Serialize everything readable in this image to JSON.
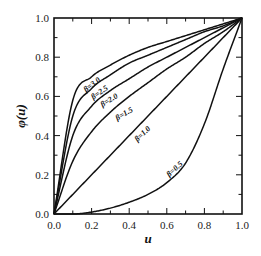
{
  "chart_data": {
    "type": "line",
    "title": "",
    "xlabel": "u",
    "ylabel": "φ(u)",
    "xlim": [
      0.0,
      1.0
    ],
    "ylim": [
      0.0,
      1.0
    ],
    "grid": false,
    "legend": "inline labels along curves",
    "xticks": [
      "0.0",
      "0.2",
      "0.4",
      "0.6",
      "0.8",
      "1.0"
    ],
    "yticks": [
      "0.0",
      "0.2",
      "0.4",
      "0.6",
      "0.8",
      "1.0"
    ],
    "x": [
      0.0,
      0.1,
      0.2,
      0.3,
      0.4,
      0.5,
      0.6,
      0.7,
      0.8,
      0.9,
      1.0
    ],
    "series": [
      {
        "name": "β=3.0",
        "values": [
          0.0,
          0.58,
          0.7,
          0.76,
          0.81,
          0.85,
          0.88,
          0.91,
          0.94,
          0.97,
          1.0
        ]
      },
      {
        "name": "β=2.5",
        "values": [
          0.0,
          0.5,
          0.64,
          0.71,
          0.77,
          0.81,
          0.85,
          0.89,
          0.93,
          0.96,
          1.0
        ]
      },
      {
        "name": "β=2.0",
        "values": [
          0.0,
          0.4,
          0.55,
          0.63,
          0.69,
          0.75,
          0.8,
          0.85,
          0.9,
          0.95,
          1.0
        ]
      },
      {
        "name": "β=1.5",
        "values": [
          0.0,
          0.27,
          0.42,
          0.52,
          0.6,
          0.67,
          0.74,
          0.8,
          0.87,
          0.93,
          1.0
        ]
      },
      {
        "name": "β=1.0",
        "values": [
          0.0,
          0.1,
          0.2,
          0.3,
          0.4,
          0.5,
          0.6,
          0.7,
          0.8,
          0.9,
          1.0
        ]
      },
      {
        "name": "β=0.5",
        "values": [
          0.0,
          0.0,
          0.01,
          0.03,
          0.06,
          0.1,
          0.16,
          0.26,
          0.46,
          0.74,
          1.0
        ]
      }
    ],
    "annotations": [
      {
        "text": "β=3.0",
        "u": 0.21,
        "phi": 0.65,
        "angle": -38
      },
      {
        "text": "β=2.5",
        "u": 0.25,
        "phi": 0.61,
        "angle": -35
      },
      {
        "text": "β=2.0",
        "u": 0.3,
        "phi": 0.57,
        "angle": -32
      },
      {
        "text": "β=1.5",
        "u": 0.38,
        "phi": 0.5,
        "angle": -30
      },
      {
        "text": "β=1.0",
        "u": 0.48,
        "phi": 0.4,
        "angle": -44
      },
      {
        "text": "β=0.5",
        "u": 0.65,
        "phi": 0.22,
        "angle": -42
      }
    ]
  },
  "axes": {
    "x_title": "u",
    "y_title": "φ(u)"
  }
}
